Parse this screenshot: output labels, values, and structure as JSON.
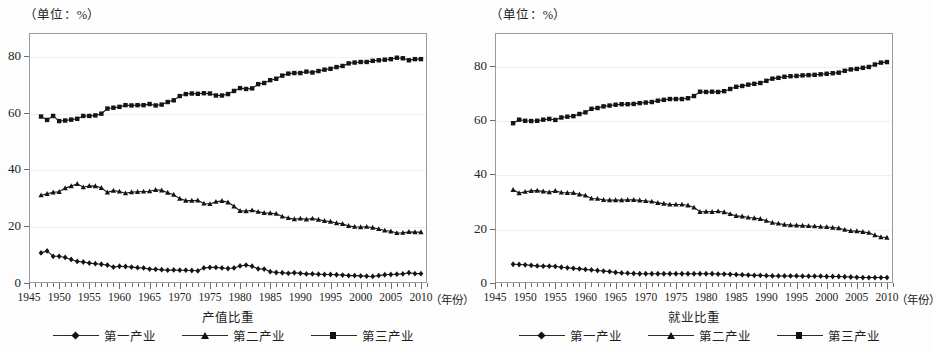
{
  "panels": [
    {
      "id": "output-value",
      "unit_label": "（单位：%）",
      "caption": "产值比重",
      "year_caption": "（年份）",
      "legend": [
        {
          "label": "第一产业",
          "marker": "diamond"
        },
        {
          "label": "第二产业",
          "marker": "triangle"
        },
        {
          "label": "第三产业",
          "marker": "square"
        }
      ]
    },
    {
      "id": "employment",
      "unit_label": "（单位：%）",
      "caption": "就业比重",
      "year_caption": "（年份）",
      "legend": [
        {
          "label": "第一产业",
          "marker": "diamond"
        },
        {
          "label": "第二产业",
          "marker": "triangle"
        },
        {
          "label": "第三产业",
          "marker": "square"
        }
      ]
    }
  ],
  "chart_data": [
    {
      "type": "line",
      "id": "output-value",
      "title": "产值比重",
      "xlabel": "（年份）",
      "ylabel": "（单位：%）",
      "xlim": [
        1945,
        2011
      ],
      "ylim": [
        0,
        88
      ],
      "yticks": [
        0,
        20,
        40,
        60,
        80
      ],
      "xticks": [
        1945,
        1950,
        1955,
        1960,
        1965,
        1970,
        1975,
        1980,
        1985,
        1990,
        1995,
        2000,
        2005,
        2010
      ],
      "xtick_minor_step": 1,
      "grid": true,
      "legend_position": "below",
      "x": [
        1947,
        1948,
        1949,
        1950,
        1951,
        1952,
        1953,
        1954,
        1955,
        1956,
        1957,
        1958,
        1959,
        1960,
        1961,
        1962,
        1963,
        1964,
        1965,
        1966,
        1967,
        1968,
        1969,
        1970,
        1971,
        1972,
        1973,
        1974,
        1975,
        1976,
        1977,
        1978,
        1979,
        1980,
        1981,
        1982,
        1983,
        1984,
        1985,
        1986,
        1987,
        1988,
        1989,
        1990,
        1991,
        1992,
        1993,
        1994,
        1995,
        1996,
        1997,
        1998,
        1999,
        2000,
        2001,
        2002,
        2003,
        2004,
        2005,
        2006,
        2007,
        2008,
        2009,
        2010
      ],
      "series": [
        {
          "name": "第一产业",
          "marker": "diamond",
          "values": [
            10.6,
            11.3,
            9.4,
            9.4,
            9.0,
            8.3,
            7.6,
            7.4,
            7.0,
            6.8,
            6.6,
            6.3,
            5.6,
            5.9,
            5.8,
            5.6,
            5.4,
            5.3,
            4.9,
            4.8,
            4.7,
            4.5,
            4.6,
            4.5,
            4.5,
            4.4,
            4.3,
            5.3,
            5.5,
            5.5,
            5.3,
            5.1,
            5.3,
            6.0,
            6.3,
            5.9,
            5.0,
            4.9,
            4.0,
            3.7,
            3.6,
            3.4,
            3.6,
            3.4,
            3.2,
            3.2,
            3.1,
            3.0,
            3.0,
            2.9,
            2.8,
            2.6,
            2.6,
            2.5,
            2.4,
            2.3,
            2.6,
            2.9,
            3.0,
            3.1,
            3.2,
            3.6,
            3.3,
            3.3
          ]
        },
        {
          "name": "第二产业",
          "marker": "triangle",
          "values": [
            30.9,
            31.4,
            31.9,
            32.1,
            33.4,
            34.1,
            34.9,
            33.7,
            34.2,
            34.1,
            33.5,
            31.9,
            32.5,
            32.2,
            31.6,
            32.0,
            32.1,
            32.2,
            32.3,
            32.8,
            32.6,
            31.8,
            31.1,
            29.7,
            29.0,
            29.0,
            29.1,
            28.0,
            27.8,
            28.6,
            28.9,
            28.4,
            27.0,
            25.4,
            25.3,
            25.6,
            25.1,
            24.7,
            24.6,
            24.4,
            23.4,
            22.9,
            22.5,
            22.7,
            22.4,
            22.7,
            22.3,
            21.9,
            21.6,
            21.1,
            20.8,
            20.1,
            19.8,
            19.7,
            19.8,
            19.5,
            19.0,
            18.5,
            18.2,
            17.6,
            17.7,
            18.0,
            17.9,
            17.9
          ]
        },
        {
          "name": "第三产业",
          "marker": "square",
          "values": [
            58.6,
            57.4,
            58.8,
            57.0,
            57.2,
            57.5,
            57.8,
            58.8,
            58.8,
            59.0,
            59.6,
            61.4,
            61.7,
            62.0,
            62.6,
            62.5,
            62.6,
            62.6,
            63.0,
            62.5,
            62.8,
            63.7,
            64.3,
            65.8,
            66.5,
            66.7,
            66.6,
            66.8,
            66.7,
            66.0,
            66.0,
            66.5,
            67.6,
            68.6,
            68.3,
            68.5,
            70.0,
            70.4,
            71.4,
            71.9,
            73.0,
            73.7,
            73.9,
            73.9,
            74.4,
            74.1,
            74.6,
            75.1,
            75.4,
            76.0,
            76.4,
            77.3,
            77.6,
            77.8,
            77.8,
            78.2,
            78.4,
            78.6,
            78.8,
            79.3,
            79.1,
            78.4,
            78.8,
            78.8
          ]
        }
      ]
    },
    {
      "type": "line",
      "id": "employment",
      "title": "就业比重",
      "xlabel": "（年份）",
      "ylabel": "（单位：%）",
      "xlim": [
        1945,
        2011
      ],
      "ylim": [
        0,
        92
      ],
      "yticks": [
        0,
        20,
        40,
        60,
        80
      ],
      "xticks": [
        1945,
        1950,
        1955,
        1960,
        1965,
        1970,
        1975,
        1980,
        1985,
        1990,
        1995,
        2000,
        2005,
        2010
      ],
      "xtick_minor_step": 1,
      "grid": true,
      "legend_position": "below",
      "x": [
        1948,
        1949,
        1950,
        1951,
        1952,
        1953,
        1954,
        1955,
        1956,
        1957,
        1958,
        1959,
        1960,
        1961,
        1962,
        1963,
        1964,
        1965,
        1966,
        1967,
        1968,
        1969,
        1970,
        1971,
        1972,
        1973,
        1974,
        1975,
        1976,
        1977,
        1978,
        1979,
        1980,
        1981,
        1982,
        1983,
        1984,
        1985,
        1986,
        1987,
        1988,
        1989,
        1990,
        1991,
        1992,
        1993,
        1994,
        1995,
        1996,
        1997,
        1998,
        1999,
        2000,
        2001,
        2002,
        2003,
        2004,
        2005,
        2006,
        2007,
        2008,
        2009,
        2010
      ],
      "series": [
        {
          "name": "第一产业",
          "marker": "diamond",
          "values": [
            6.9,
            6.8,
            6.7,
            6.5,
            6.3,
            6.2,
            6.2,
            6.1,
            5.8,
            5.6,
            5.4,
            5.2,
            5.0,
            4.8,
            4.6,
            4.4,
            4.2,
            3.9,
            3.7,
            3.6,
            3.5,
            3.4,
            3.4,
            3.4,
            3.4,
            3.4,
            3.4,
            3.4,
            3.4,
            3.4,
            3.4,
            3.4,
            3.4,
            3.4,
            3.3,
            3.3,
            3.2,
            3.1,
            3.0,
            2.9,
            2.8,
            2.8,
            2.7,
            2.6,
            2.6,
            2.6,
            2.6,
            2.6,
            2.5,
            2.5,
            2.5,
            2.5,
            2.4,
            2.4,
            2.4,
            2.3,
            2.2,
            2.1,
            2.0,
            2.0,
            2.0,
            2.0,
            2.0
          ]
        },
        {
          "name": "第二产业",
          "marker": "triangle",
          "values": [
            34.3,
            33.1,
            33.6,
            33.9,
            34.0,
            33.7,
            33.4,
            33.9,
            33.3,
            33.2,
            33.2,
            32.6,
            32.2,
            31.1,
            31.0,
            30.6,
            30.5,
            30.5,
            30.5,
            30.6,
            30.6,
            30.4,
            30.2,
            30.0,
            29.5,
            29.2,
            28.9,
            28.9,
            28.9,
            28.6,
            27.8,
            26.2,
            26.3,
            26.2,
            26.4,
            26.1,
            25.4,
            24.7,
            24.5,
            24.1,
            23.9,
            23.6,
            22.9,
            22.2,
            21.9,
            21.5,
            21.3,
            21.2,
            21.1,
            21.0,
            20.9,
            20.7,
            20.6,
            20.4,
            20.2,
            19.6,
            19.2,
            19.1,
            18.8,
            18.5,
            17.6,
            16.9,
            16.7
          ]
        },
        {
          "name": "第三产业",
          "marker": "square",
          "values": [
            58.8,
            60.1,
            59.7,
            59.6,
            59.7,
            60.1,
            60.4,
            60.0,
            60.9,
            61.2,
            61.4,
            62.2,
            62.8,
            64.1,
            64.4,
            65.0,
            65.3,
            65.6,
            65.8,
            65.8,
            65.9,
            66.2,
            66.4,
            66.6,
            67.1,
            67.4,
            67.7,
            67.7,
            67.7,
            68.0,
            68.8,
            70.4,
            70.3,
            70.4,
            70.3,
            70.6,
            71.4,
            72.2,
            72.5,
            73.0,
            73.3,
            73.6,
            74.4,
            75.2,
            75.5,
            75.9,
            76.1,
            76.2,
            76.4,
            76.5,
            76.6,
            76.8,
            77.0,
            77.2,
            77.4,
            78.1,
            78.6,
            78.8,
            79.2,
            79.5,
            80.4,
            81.1,
            81.3
          ]
        }
      ]
    }
  ]
}
